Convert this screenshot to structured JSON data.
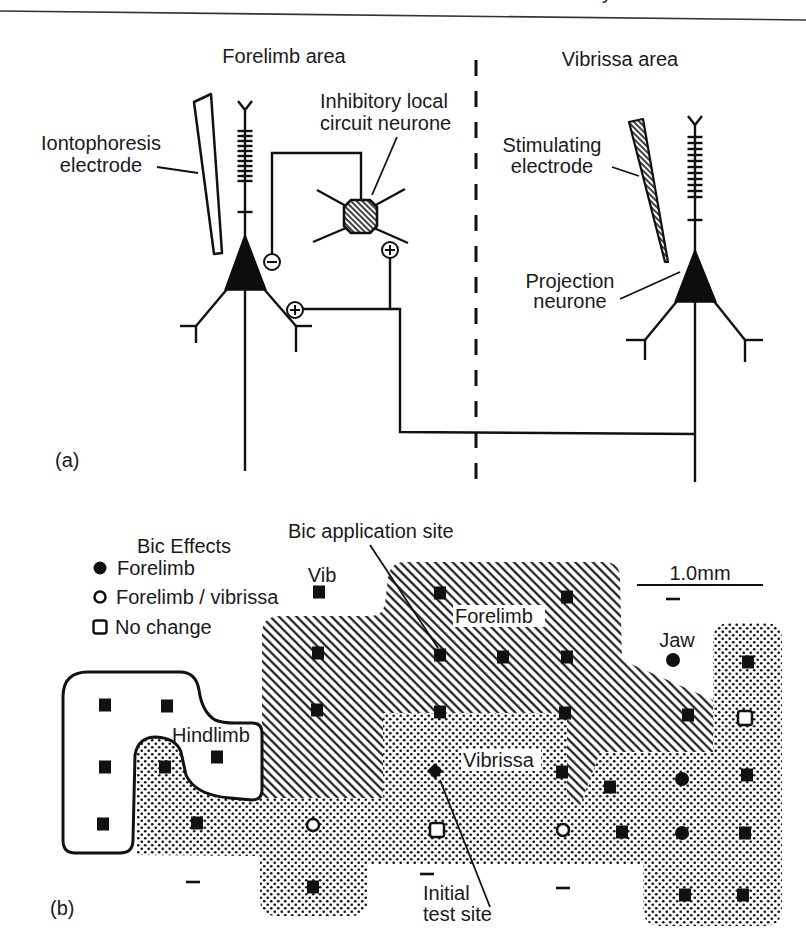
{
  "page": {
    "header_fragment": "y"
  },
  "panel_a": {
    "label": "(a)",
    "titles": {
      "forelimb_area": "Forelimb area",
      "vibrissa_area": "Vibrissa area"
    },
    "iontophoresis_electrode": [
      "Iontophoresis",
      "electrode"
    ],
    "inhibitory_neurone": [
      "Inhibitory local",
      "circuit neurone"
    ],
    "stimulating_electrode": [
      "Stimulating",
      "electrode"
    ],
    "projection_neurone": [
      "Projection",
      "neurone"
    ]
  },
  "panel_b": {
    "label": "(b)",
    "legend": {
      "title": "Bic Effects",
      "items": [
        {
          "symbol": "filled-circle",
          "label": "Forelimb"
        },
        {
          "symbol": "open-circle",
          "label": "Forelimb / vibrissa"
        },
        {
          "symbol": "open-square",
          "label": "No change"
        }
      ]
    },
    "annotations": {
      "bic_application_site": "Bic application site",
      "vib": "Vib",
      "jaw": "Jaw",
      "initial_test_site": [
        "Initial",
        "test site"
      ]
    },
    "regions": {
      "forelimb": "Forelimb",
      "vibrissa": "Vibrissa",
      "hindlimb": "Hindlimb"
    },
    "scale_bar": {
      "label": "1.0mm"
    },
    "markers": [
      {
        "type": "site",
        "x": 319,
        "y": 592
      },
      {
        "type": "site",
        "x": 440,
        "y": 593
      },
      {
        "type": "site",
        "x": 567,
        "y": 597
      },
      {
        "type": "site",
        "x": 318,
        "y": 653
      },
      {
        "type": "site",
        "x": 440,
        "y": 655
      },
      {
        "type": "site",
        "x": 503,
        "y": 657
      },
      {
        "type": "site",
        "x": 567,
        "y": 657
      },
      {
        "type": "site",
        "x": 748,
        "y": 662
      },
      {
        "type": "site",
        "x": 317,
        "y": 710
      },
      {
        "type": "site",
        "x": 440,
        "y": 712
      },
      {
        "type": "site",
        "x": 565,
        "y": 713
      },
      {
        "type": "site",
        "x": 688,
        "y": 715
      },
      {
        "type": "site",
        "x": 105,
        "y": 705
      },
      {
        "type": "site",
        "x": 167,
        "y": 706
      },
      {
        "type": "site",
        "x": 217,
        "y": 757
      },
      {
        "type": "site",
        "x": 105,
        "y": 767
      },
      {
        "type": "site",
        "x": 165,
        "y": 767
      },
      {
        "type": "site",
        "x": 562,
        "y": 772
      },
      {
        "type": "site",
        "x": 610,
        "y": 787
      },
      {
        "type": "site",
        "x": 747,
        "y": 775
      },
      {
        "type": "site",
        "x": 103,
        "y": 824
      },
      {
        "type": "site",
        "x": 197,
        "y": 823
      },
      {
        "type": "site",
        "x": 622,
        "y": 832
      },
      {
        "type": "site",
        "x": 745,
        "y": 833
      },
      {
        "type": "site",
        "x": 313,
        "y": 887
      },
      {
        "type": "site",
        "x": 685,
        "y": 895
      },
      {
        "type": "site",
        "x": 743,
        "y": 895
      },
      {
        "type": "forelimb",
        "x": 673,
        "y": 660
      },
      {
        "type": "forelimb",
        "x": 682,
        "y": 779
      },
      {
        "type": "forelimb",
        "x": 682,
        "y": 833
      },
      {
        "type": "forelimb-vibrissa",
        "x": 313,
        "y": 825
      },
      {
        "type": "forelimb-vibrissa",
        "x": 563,
        "y": 830
      },
      {
        "type": "no-change",
        "x": 745,
        "y": 718
      },
      {
        "type": "no-change",
        "x": 437,
        "y": 830
      },
      {
        "type": "initial-test-site",
        "x": 435,
        "y": 771
      },
      {
        "type": "dash",
        "x": 673,
        "y": 599
      },
      {
        "type": "dash",
        "x": 193,
        "y": 882
      },
      {
        "type": "dash",
        "x": 427,
        "y": 874
      },
      {
        "type": "dash",
        "x": 563,
        "y": 888
      }
    ]
  },
  "colors": {
    "ink": "#111111",
    "paper": "#ffffff"
  }
}
